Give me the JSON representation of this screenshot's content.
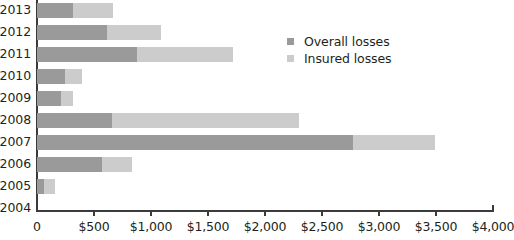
{
  "chart_data": {
    "type": "bar",
    "orientation": "horizontal",
    "stacked": false,
    "title": "",
    "xlabel": "",
    "ylabel": "",
    "xlim": [
      0,
      4000
    ],
    "xticks": [
      0,
      500,
      1000,
      1500,
      2000,
      2500,
      3000,
      3500,
      4000
    ],
    "xtick_labels": [
      "0",
      "$500",
      "$1,000",
      "$1,500",
      "$2,000",
      "$2,500",
      "$3,000",
      "$3,500",
      "$4,000"
    ],
    "grid": false,
    "legend_position": "upper-right-inside",
    "categories": [
      "2013",
      "2012",
      "2011",
      "2010",
      "2009",
      "2008",
      "2007",
      "2006",
      "2005",
      "2004"
    ],
    "series": [
      {
        "name": "Overall losses",
        "color": "#9a9a9a",
        "values": [
          665,
          1090,
          1715,
          395,
          315,
          2295,
          3490,
          830,
          155,
          0
        ]
      },
      {
        "name": "Insured losses",
        "color": "#cccccc",
        "values": [
          315,
          615,
          875,
          245,
          210,
          655,
          2770,
          570,
          65,
          0
        ]
      }
    ],
    "axis_color": "#3b3b3b",
    "text_color": "#231f20",
    "background": "#ffffff"
  },
  "legend": {
    "items": [
      {
        "label": "Overall losses",
        "color": "#9a9a9a"
      },
      {
        "label": "Insured losses",
        "color": "#cccccc"
      }
    ]
  }
}
